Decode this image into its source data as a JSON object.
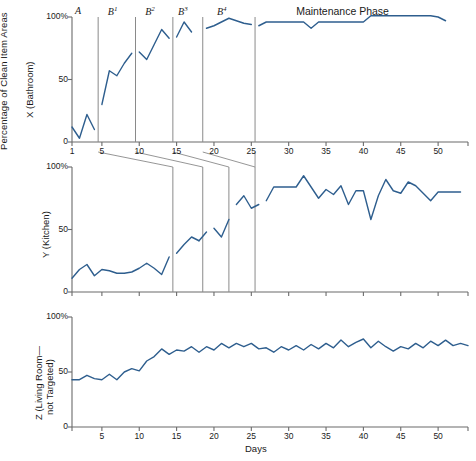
{
  "figure": {
    "shared_ylabel": "Percentage of Clean Item Areas",
    "xlabel": "Days",
    "line_color": "#2E5E8E",
    "axis_color": "#6b6b6b",
    "phase_line_color": "#8a8a8a"
  },
  "phase_labels": {
    "a": "A",
    "b1_base": "B",
    "b1_sup": "1",
    "b2_base": "B",
    "b2_sup": "2",
    "b3_base": "B",
    "b3_sup": "3",
    "b4_base": "B",
    "b4_sup": "4",
    "maintenance": "Maintenance Phase"
  },
  "chart_data": {
    "type": "line",
    "title": "",
    "xlabel": "Days",
    "ylabel": "Percentage of Clean Item Areas",
    "xlim": [
      1,
      54
    ],
    "ylim": [
      0,
      100
    ],
    "grid": false,
    "legend": "none",
    "design": "multiple-baseline across behaviors with A, B1-B4 and Maintenance phases",
    "xticks": [
      1,
      5,
      10,
      15,
      20,
      25,
      30,
      35,
      40,
      45,
      50
    ],
    "xticklabels": [
      "1",
      "5",
      "10",
      "15",
      "20",
      "25",
      "30",
      "35",
      "40",
      "45",
      "50"
    ],
    "yticks": [
      0,
      50,
      100
    ],
    "yticklabels": [
      "0",
      "50",
      "100%"
    ],
    "panels": [
      {
        "key": "x",
        "ylabel": "X (Bathroom)",
        "yticklabels": [
          "0",
          "50",
          "100%"
        ],
        "xticklabels": [
          "1",
          "5",
          "10",
          "15",
          "20",
          "25",
          "30",
          "35",
          "40",
          "45",
          "50"
        ],
        "phase_lines": [
          4.5,
          9.5,
          14.5,
          18.5,
          25.5
        ],
        "phase_label_positions": [
          {
            "label": "A",
            "x": 2.6
          },
          {
            "label": "B1",
            "x": 7.0
          },
          {
            "label": "B2",
            "x": 12.0
          },
          {
            "label": "B3",
            "x": 16.4
          },
          {
            "label": "B4",
            "x": 21.6
          },
          {
            "label": "Maintenance Phase",
            "x": 38.0
          }
        ],
        "segments": [
          {
            "phase": "A",
            "x": [
              1,
              2,
              3,
              4
            ],
            "y": [
              12,
              3,
              22,
              10
            ]
          },
          {
            "phase": "B1",
            "x": [
              5,
              6,
              7,
              8,
              9
            ],
            "y": [
              30,
              57,
              53,
              63,
              71
            ]
          },
          {
            "phase": "B2",
            "x": [
              10,
              11,
              12,
              13,
              14
            ],
            "y": [
              72,
              66,
              78,
              90,
              83
            ]
          },
          {
            "phase": "B3",
            "x": [
              15,
              16,
              17
            ],
            "y": [
              84,
              96,
              88
            ]
          },
          {
            "phase": "B4",
            "x": [
              19,
              20,
              21,
              22,
              23,
              24,
              25
            ],
            "y": [
              91,
              93,
              96,
              99,
              97,
              95,
              94
            ]
          },
          {
            "phase": "Maintenance",
            "x": [
              26,
              27,
              28,
              29,
              30,
              31,
              32,
              33,
              34,
              35,
              36,
              37,
              38,
              39,
              40,
              41,
              42,
              43,
              44,
              45,
              46,
              47,
              48,
              49,
              50,
              51
            ],
            "y": [
              93,
              96,
              96,
              96,
              96,
              96,
              96,
              91,
              96,
              96,
              96,
              96,
              96,
              96,
              96,
              101,
              101,
              101,
              101,
              101,
              101,
              101,
              101,
              101,
              100,
              97
            ]
          }
        ]
      },
      {
        "key": "y",
        "ylabel": "Y (Kitchen)",
        "yticklabels": [
          "0",
          "50",
          "100%"
        ],
        "phase_lines": [
          14.5,
          18.5,
          22.0,
          25.5
        ],
        "segments": [
          {
            "phase": "Baseline",
            "x": [
              1,
              2,
              3,
              4,
              5,
              6,
              7,
              8,
              9,
              10,
              11,
              12,
              13,
              14
            ],
            "y": [
              11,
              18,
              22,
              13,
              18,
              17,
              15,
              15,
              16,
              19,
              23,
              19,
              14,
              28
            ]
          },
          {
            "phase": "B2",
            "x": [
              15,
              16,
              17,
              18
            ],
            "y": [
              31,
              38,
              44,
              41
            ]
          },
          {
            "phase": "B2b",
            "x": [
              18,
              19
            ],
            "y": [
              41,
              48
            ]
          },
          {
            "phase": "B3",
            "x": [
              20,
              21,
              22
            ],
            "y": [
              51,
              44,
              58
            ]
          },
          {
            "phase": "B4",
            "x": [
              23,
              24,
              25,
              26
            ],
            "y": [
              70,
              77,
              67,
              70
            ]
          },
          {
            "phase": "Maintenance",
            "x": [
              27,
              28,
              29,
              30,
              31,
              32,
              33,
              34,
              35,
              36,
              37,
              38,
              39,
              40,
              41,
              42,
              43,
              44,
              45,
              46,
              47,
              48,
              49,
              50,
              51,
              52,
              53
            ],
            "y": [
              73,
              84,
              84,
              84,
              84,
              93,
              84,
              75,
              82,
              78,
              85,
              70,
              81,
              81,
              58,
              77,
              90,
              81,
              79,
              88,
              85,
              79,
              73,
              80,
              80,
              80,
              80
            ]
          }
        ]
      },
      {
        "key": "z",
        "ylabel": "Z (Living Room— not Targeted)",
        "ylabel_line1": "Z (Living Room—",
        "ylabel_line2": "not Targeted)",
        "yticklabels": [
          "0",
          "50",
          "100%"
        ],
        "phase_lines": [],
        "segments": [
          {
            "phase": "Continuous",
            "x": [
              1,
              2,
              3,
              4,
              5,
              6,
              7,
              8,
              9,
              10,
              11,
              12,
              13,
              14,
              15,
              16,
              17,
              18,
              19,
              20,
              21,
              22,
              23,
              24,
              25,
              26,
              27,
              28,
              29,
              30,
              31,
              32,
              33,
              34,
              35,
              36,
              37,
              38,
              39,
              40,
              41,
              42,
              43,
              44,
              45,
              46,
              47,
              48,
              49,
              50,
              51,
              52,
              53,
              54
            ],
            "y": [
              43,
              43,
              47,
              44,
              43,
              48,
              43,
              50,
              53,
              51,
              60,
              64,
              71,
              66,
              70,
              69,
              73,
              68,
              73,
              70,
              76,
              72,
              76,
              73,
              76,
              71,
              72,
              68,
              73,
              70,
              74,
              70,
              75,
              71,
              76,
              72,
              79,
              73,
              77,
              80,
              72,
              78,
              73,
              69,
              73,
              71,
              76,
              72,
              78,
              74,
              79,
              74,
              76,
              74
            ]
          }
        ]
      }
    ]
  }
}
